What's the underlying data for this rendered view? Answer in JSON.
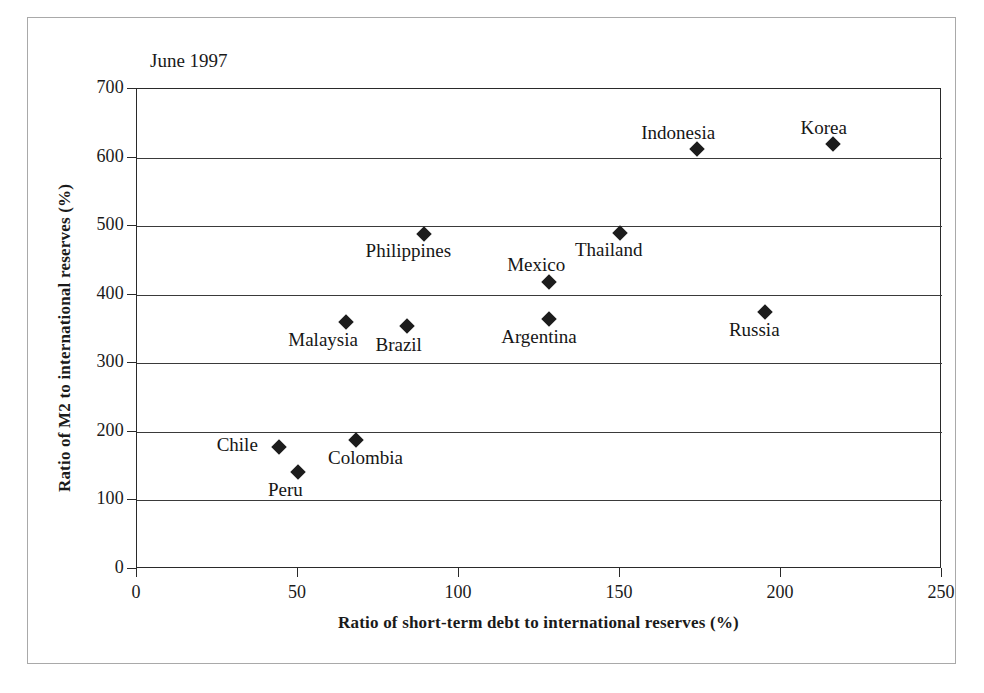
{
  "chart_data": {
    "type": "scatter",
    "title": "June 1997",
    "xlabel": "Ratio of short-term debt to international reserves (%)",
    "ylabel": "Ratio of M2 to international reserves (%)",
    "xlim": [
      0,
      250
    ],
    "ylim": [
      0,
      700
    ],
    "xticks": [
      0,
      50,
      100,
      150,
      200,
      250
    ],
    "yticks": [
      0,
      100,
      200,
      300,
      400,
      500,
      600,
      700
    ],
    "grid": "horizontal",
    "legend": "none",
    "marker": "diamond",
    "marker_color": "#1c1c1c",
    "points": [
      {
        "label": "Indonesia",
        "x": 174,
        "y": 612,
        "label_dx": -56,
        "label_dy": -27
      },
      {
        "label": "Korea",
        "x": 216,
        "y": 620,
        "label_dx": -32,
        "label_dy": -27
      },
      {
        "label": "Philippines",
        "x": 89,
        "y": 488,
        "label_dx": -58,
        "label_dy": 6
      },
      {
        "label": "Thailand",
        "x": 150,
        "y": 490,
        "label_dx": -45,
        "label_dy": 6
      },
      {
        "label": "Mexico",
        "x": 128,
        "y": 418,
        "label_dx": -42,
        "label_dy": -28
      },
      {
        "label": "Malaysia",
        "x": 65,
        "y": 360,
        "label_dx": -58,
        "label_dy": 7
      },
      {
        "label": "Brazil",
        "x": 84,
        "y": 355,
        "label_dx": -32,
        "label_dy": 8
      },
      {
        "label": "Argentina",
        "x": 128,
        "y": 365,
        "label_dx": -48,
        "label_dy": 7
      },
      {
        "label": "Russia",
        "x": 195,
        "y": 375,
        "label_dx": -36,
        "label_dy": 7
      },
      {
        "label": "Chile",
        "x": 44,
        "y": 178,
        "label_dx": -62,
        "label_dy": -13
      },
      {
        "label": "Colombia",
        "x": 68,
        "y": 188,
        "label_dx": -28,
        "label_dy": 7
      },
      {
        "label": "Peru",
        "x": 50,
        "y": 142,
        "label_dx": -30,
        "label_dy": 7
      }
    ]
  }
}
